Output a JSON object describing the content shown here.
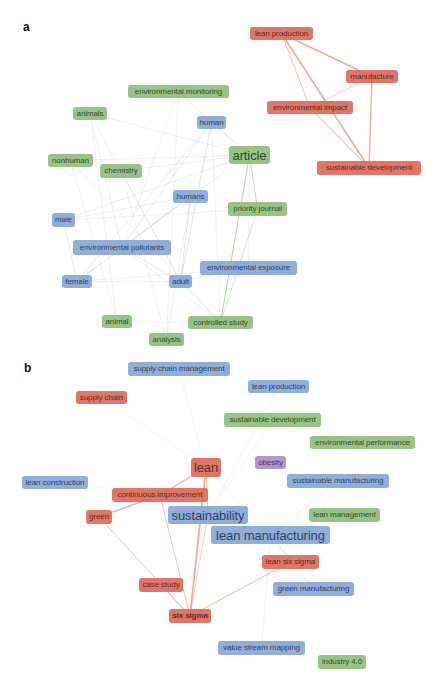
{
  "panels": [
    {
      "label": "a",
      "nodes": [
        {
          "id": "lean-production",
          "label": "lean production",
          "cluster": "red",
          "x": 250,
          "y": 27,
          "w": 63,
          "h": 13
        },
        {
          "id": "manufacture",
          "label": "manufacture",
          "cluster": "red",
          "x": 346,
          "y": 70,
          "w": 52,
          "h": 13
        },
        {
          "id": "environmental-impact",
          "label": "environmental impact",
          "cluster": "red",
          "x": 267,
          "y": 101,
          "w": 86,
          "h": 13
        },
        {
          "id": "sustainable-development",
          "label": "sustainable development",
          "cluster": "red",
          "x": 317,
          "y": 161,
          "w": 104,
          "h": 14
        },
        {
          "id": "environmental-monitoring",
          "label": "environmental monitoring",
          "cluster": "green",
          "x": 128,
          "y": 85,
          "w": 101,
          "h": 13
        },
        {
          "id": "animals",
          "label": "animals",
          "cluster": "green",
          "x": 73,
          "y": 107,
          "w": 34,
          "h": 13
        },
        {
          "id": "human",
          "label": "human",
          "cluster": "blue",
          "x": 197,
          "y": 116,
          "w": 29,
          "h": 13
        },
        {
          "id": "article",
          "label": "article",
          "cluster": "green",
          "x": 229,
          "y": 146,
          "w": 41,
          "h": 18,
          "size": "big"
        },
        {
          "id": "nonhuman",
          "label": "nonhuman",
          "cluster": "green",
          "x": 48,
          "y": 154,
          "w": 45,
          "h": 13
        },
        {
          "id": "chemistry",
          "label": "chemistry",
          "cluster": "green",
          "x": 100,
          "y": 164,
          "w": 42,
          "h": 14
        },
        {
          "id": "humans",
          "label": "humans",
          "cluster": "blue",
          "x": 173,
          "y": 190,
          "w": 35,
          "h": 13
        },
        {
          "id": "priority-journal",
          "label": "priority journal",
          "cluster": "green",
          "x": 228,
          "y": 202,
          "w": 59,
          "h": 14
        },
        {
          "id": "male",
          "label": "male",
          "cluster": "blue",
          "x": 52,
          "y": 213,
          "w": 23,
          "h": 14
        },
        {
          "id": "environmental-pollutants",
          "label": "environmental pollutants",
          "cluster": "blue",
          "x": 73,
          "y": 240,
          "w": 98,
          "h": 15
        },
        {
          "id": "environmental-exposure",
          "label": "environmental exposure",
          "cluster": "blue",
          "x": 200,
          "y": 261,
          "w": 97,
          "h": 14
        },
        {
          "id": "female",
          "label": "female",
          "cluster": "blue",
          "x": 62,
          "y": 275,
          "w": 30,
          "h": 13
        },
        {
          "id": "adult",
          "label": "adult",
          "cluster": "blue",
          "x": 169,
          "y": 275,
          "w": 23,
          "h": 13
        },
        {
          "id": "animal",
          "label": "animal",
          "cluster": "green",
          "x": 102,
          "y": 315,
          "w": 30,
          "h": 13
        },
        {
          "id": "controlled-study",
          "label": "controlled study",
          "cluster": "green",
          "x": 188,
          "y": 316,
          "w": 65,
          "h": 13
        },
        {
          "id": "analysis",
          "label": "analysis",
          "cluster": "green",
          "x": 149,
          "y": 333,
          "w": 35,
          "h": 13
        }
      ],
      "edges": [
        {
          "from": "lean-production",
          "to": "manufacture",
          "color": "red",
          "width": 1.4
        },
        {
          "from": "lean-production",
          "to": "sustainable-development",
          "color": "red",
          "width": 1.6
        },
        {
          "from": "lean-production",
          "to": "environmental-impact",
          "color": "red",
          "width": 0.8
        },
        {
          "from": "manufacture",
          "to": "sustainable-development",
          "color": "red",
          "width": 1.4
        },
        {
          "from": "manufacture",
          "to": "environmental-impact",
          "color": "red",
          "width": 0.6
        },
        {
          "from": "environmental-impact",
          "to": "sustainable-development",
          "color": "red",
          "width": 1.0
        },
        {
          "from": "human",
          "to": "article",
          "color": "gray",
          "width": 0.8
        },
        {
          "from": "human",
          "to": "adult",
          "color": "gray",
          "width": 0.8
        },
        {
          "from": "human",
          "to": "environmental-pollutants",
          "color": "gray",
          "width": 0.6
        },
        {
          "from": "human",
          "to": "environmental-monitoring",
          "color": "gray",
          "width": 0.5
        },
        {
          "from": "human",
          "to": "female",
          "color": "gray",
          "width": 0.5
        },
        {
          "from": "human",
          "to": "controlled-study",
          "color": "gray",
          "width": 0.5
        },
        {
          "from": "article",
          "to": "controlled-study",
          "color": "green",
          "width": 1.0
        },
        {
          "from": "article",
          "to": "priority-journal",
          "color": "green",
          "width": 0.8
        },
        {
          "from": "article",
          "to": "humans",
          "color": "gray",
          "width": 0.6
        },
        {
          "from": "article",
          "to": "nonhuman",
          "color": "gray",
          "width": 0.5
        },
        {
          "from": "article",
          "to": "animals",
          "color": "gray",
          "width": 0.5
        },
        {
          "from": "article",
          "to": "environmental-exposure",
          "color": "gray",
          "width": 0.5
        },
        {
          "from": "article",
          "to": "chemistry",
          "color": "gray",
          "width": 0.5
        },
        {
          "from": "article",
          "to": "male",
          "color": "gray",
          "width": 0.5
        },
        {
          "from": "humans",
          "to": "female",
          "color": "gray",
          "width": 0.9
        },
        {
          "from": "humans",
          "to": "adult",
          "color": "gray",
          "width": 0.8
        },
        {
          "from": "humans",
          "to": "environmental-pollutants",
          "color": "gray",
          "width": 0.6
        },
        {
          "from": "humans",
          "to": "male",
          "color": "gray",
          "width": 0.5
        },
        {
          "from": "humans",
          "to": "analysis",
          "color": "gray",
          "width": 0.5
        },
        {
          "from": "environmental-pollutants",
          "to": "adult",
          "color": "gray",
          "width": 0.6
        },
        {
          "from": "environmental-pollutants",
          "to": "controlled-study",
          "color": "gray",
          "width": 0.5
        },
        {
          "from": "environmental-pollutants",
          "to": "animals",
          "color": "gray",
          "width": 0.5
        },
        {
          "from": "male",
          "to": "female",
          "color": "gray",
          "width": 0.6
        },
        {
          "from": "male",
          "to": "priority-journal",
          "color": "gray",
          "width": 0.4
        },
        {
          "from": "female",
          "to": "adult",
          "color": "gray",
          "width": 0.5
        },
        {
          "from": "adult",
          "to": "controlled-study",
          "color": "gray",
          "width": 0.6
        },
        {
          "from": "adult",
          "to": "environmental-exposure",
          "color": "gray",
          "width": 0.5
        },
        {
          "from": "animals",
          "to": "animal",
          "color": "gray",
          "width": 0.4
        },
        {
          "from": "animals",
          "to": "adult",
          "color": "gray",
          "width": 0.4
        },
        {
          "from": "nonhuman",
          "to": "animal",
          "color": "gray",
          "width": 0.4
        },
        {
          "from": "nonhuman",
          "to": "controlled-study",
          "color": "gray",
          "width": 0.4
        },
        {
          "from": "chemistry",
          "to": "analysis",
          "color": "gray",
          "width": 0.4
        },
        {
          "from": "chemistry",
          "to": "adult",
          "color": "gray",
          "width": 0.4
        },
        {
          "from": "animal",
          "to": "controlled-study",
          "color": "gray",
          "width": 0.4
        },
        {
          "from": "priority-journal",
          "to": "controlled-study",
          "color": "green",
          "width": 0.6
        },
        {
          "from": "environmental-monitoring",
          "to": "analysis",
          "color": "gray",
          "width": 0.4
        },
        {
          "from": "environmental-monitoring",
          "to": "environmental-pollutants",
          "color": "gray",
          "width": 0.4
        },
        {
          "from": "environmental-exposure",
          "to": "female",
          "color": "gray",
          "width": 0.4
        }
      ]
    },
    {
      "label": "b",
      "nodes": [
        {
          "id": "supply-chain-management",
          "label": "supply chain management",
          "cluster": "blue",
          "x": 128,
          "y": 362,
          "w": 102,
          "h": 14
        },
        {
          "id": "lean-production-b",
          "label": "lean production",
          "cluster": "blue",
          "x": 248,
          "y": 380,
          "w": 61,
          "h": 13
        },
        {
          "id": "supply-chain",
          "label": "supply chain",
          "cluster": "red",
          "x": 76,
          "y": 391,
          "w": 51,
          "h": 13
        },
        {
          "id": "sustainable-development-b",
          "label": "sustainable development",
          "cluster": "green",
          "x": 224,
          "y": 413,
          "w": 97,
          "h": 14
        },
        {
          "id": "environmental-performance",
          "label": "environmental performance",
          "cluster": "green",
          "x": 310,
          "y": 436,
          "w": 105,
          "h": 13
        },
        {
          "id": "lean",
          "label": "lean",
          "cluster": "red",
          "x": 191,
          "y": 458,
          "w": 30,
          "h": 19,
          "size": "big"
        },
        {
          "id": "obesity",
          "label": "obesity",
          "cluster": "purple",
          "x": 255,
          "y": 456,
          "w": 31,
          "h": 13
        },
        {
          "id": "lean-construction",
          "label": "lean construction",
          "cluster": "blue",
          "x": 22,
          "y": 476,
          "w": 66,
          "h": 13
        },
        {
          "id": "sustainable-manufacturing",
          "label": "sustainable manufacturing",
          "cluster": "blue",
          "x": 287,
          "y": 474,
          "w": 102,
          "h": 14
        },
        {
          "id": "continuous-improvement",
          "label": "continuous improvement",
          "cluster": "red",
          "x": 112,
          "y": 488,
          "w": 96,
          "h": 14
        },
        {
          "id": "green",
          "label": "green",
          "cluster": "red",
          "x": 86,
          "y": 510,
          "w": 26,
          "h": 14
        },
        {
          "id": "sustainability",
          "label": "sustainability",
          "cluster": "blue",
          "x": 168,
          "y": 506,
          "w": 80,
          "h": 18,
          "size": "big"
        },
        {
          "id": "lean-management",
          "label": "lean management",
          "cluster": "green",
          "x": 309,
          "y": 508,
          "w": 71,
          "h": 14
        },
        {
          "id": "lean-manufacturing",
          "label": "lean manufacturing",
          "cluster": "blue",
          "x": 211,
          "y": 526,
          "w": 119,
          "h": 18,
          "size": "big"
        },
        {
          "id": "lean-six-sigma",
          "label": "lean six sigma",
          "cluster": "red",
          "x": 262,
          "y": 555,
          "w": 57,
          "h": 14
        },
        {
          "id": "green-manufacturing",
          "label": "green manufacturing",
          "cluster": "blue",
          "x": 273,
          "y": 582,
          "w": 81,
          "h": 14
        },
        {
          "id": "case-study",
          "label": "case study",
          "cluster": "red",
          "x": 139,
          "y": 578,
          "w": 44,
          "h": 14
        },
        {
          "id": "six-sigma",
          "label": "six sigma",
          "cluster": "red",
          "x": 169,
          "y": 609,
          "w": 42,
          "h": 14,
          "bold": true
        },
        {
          "id": "value-stream-mapping",
          "label": "value stream mapping",
          "cluster": "blue",
          "x": 218,
          "y": 641,
          "w": 87,
          "h": 14
        },
        {
          "id": "industry-4-0",
          "label": "industry 4.0",
          "cluster": "green",
          "x": 318,
          "y": 655,
          "w": 48,
          "h": 14
        }
      ],
      "edges": [
        {
          "from": "lean",
          "to": "continuous-improvement",
          "color": "red",
          "width": 1.4
        },
        {
          "from": "lean",
          "to": "six-sigma",
          "color": "red",
          "width": 1.8
        },
        {
          "from": "lean",
          "to": "sustainability",
          "color": "red",
          "width": 0.8
        },
        {
          "from": "lean",
          "to": "lean-manufacturing",
          "color": "gray",
          "width": 0.5
        },
        {
          "from": "continuous-improvement",
          "to": "green",
          "color": "red",
          "width": 1.4
        },
        {
          "from": "continuous-improvement",
          "to": "six-sigma",
          "color": "red",
          "width": 0.8
        },
        {
          "from": "green",
          "to": "six-sigma",
          "color": "red",
          "width": 0.8
        },
        {
          "from": "case-study",
          "to": "six-sigma",
          "color": "red",
          "width": 0.7
        },
        {
          "from": "six-sigma",
          "to": "lean-six-sigma",
          "color": "red",
          "width": 0.9
        },
        {
          "from": "sustainability",
          "to": "six-sigma",
          "color": "red",
          "width": 0.6
        },
        {
          "from": "lean-manufacturing",
          "to": "green-manufacturing",
          "color": "gray",
          "width": 0.7
        },
        {
          "from": "lean-manufacturing",
          "to": "value-stream-mapping",
          "color": "gray",
          "width": 0.5
        },
        {
          "from": "lean-manufacturing",
          "to": "sustainable-manufacturing",
          "color": "gray",
          "width": 0.4
        },
        {
          "from": "lean-manufacturing",
          "to": "lean-six-sigma",
          "color": "gray",
          "width": 0.5
        },
        {
          "from": "sustainability",
          "to": "lean-production-b",
          "color": "gray",
          "width": 0.4
        },
        {
          "from": "sustainability",
          "to": "sustainable-development-b",
          "color": "gray",
          "width": 0.3
        },
        {
          "from": "supply-chain",
          "to": "lean",
          "color": "gray",
          "width": 0.3
        },
        {
          "from": "supply-chain-management",
          "to": "lean",
          "color": "gray",
          "width": 0.3
        },
        {
          "from": "lean-construction",
          "to": "continuous-improvement",
          "color": "gray",
          "width": 0.3
        },
        {
          "from": "sustainable-manufacturing",
          "to": "lean-six-sigma",
          "color": "gray",
          "width": 0.3
        }
      ]
    }
  ],
  "colors": {
    "red": "#e06a58",
    "green": "#8fbf7a",
    "blue": "#87a8d8",
    "purple": "#b18ac8",
    "edge_red": "#e9907f",
    "edge_green": "#9cc78a",
    "edge_gray": "#c3d2d6"
  }
}
